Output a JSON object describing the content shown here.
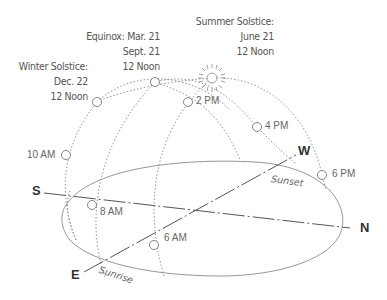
{
  "diagram": {
    "type": "sun-path-diagram",
    "labels": {
      "summer": [
        "Summer Solstice:",
        "June 21",
        "12 Noon"
      ],
      "equinox": [
        "Equinox: Mar. 21",
        "Sept. 21",
        "12 Noon"
      ],
      "winter": [
        "Winter Solstice:",
        "Dec. 22",
        "12 Noon"
      ]
    },
    "times": {
      "t2pm": "2 PM",
      "t4pm": "4 PM",
      "t6pm": "6 PM",
      "t10am": "10 AM",
      "t8am": "8 AM",
      "t6am": "6 AM"
    },
    "directions": {
      "south": "S",
      "north": "N",
      "east": "E",
      "west": "W"
    },
    "events": {
      "sunrise": "Sunrise",
      "sunset": "Sunset"
    },
    "colors": {
      "line": "#777777",
      "text": "#555555",
      "background": "#ffffff"
    }
  }
}
